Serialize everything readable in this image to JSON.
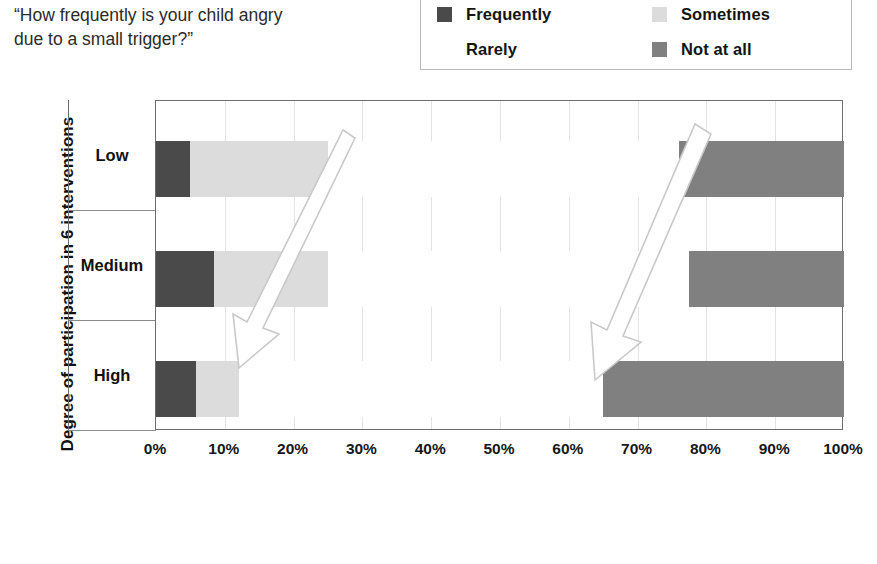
{
  "question": {
    "text": "“How frequently is your child angry\ndue to a small trigger?”"
  },
  "legend": {
    "items": [
      {
        "label": "Frequently",
        "color": "#4a4a4a"
      },
      {
        "label": "Sometimes",
        "color": "#dcdcdc"
      },
      {
        "label": "Rarely",
        "color": "#ffffff"
      },
      {
        "label": "Not at all",
        "color": "#808080"
      }
    ]
  },
  "axes": {
    "y_title": "Degree of participation in  6  interventions",
    "x_ticks": [
      "0%",
      "10%",
      "20%",
      "30%",
      "40%",
      "50%",
      "60%",
      "70%",
      "80%",
      "90%",
      "100%"
    ]
  },
  "chart_data": {
    "type": "bar",
    "orientation": "horizontal",
    "stacked": true,
    "normalized_percent": true,
    "title": "“How frequently is your child angry due to a small trigger?”",
    "xlabel": "",
    "ylabel": "Degree of participation in  6  interventions",
    "xlim": [
      0,
      100
    ],
    "xticks": [
      0,
      10,
      20,
      30,
      40,
      50,
      60,
      70,
      80,
      90,
      100
    ],
    "xticklabels": [
      "0%",
      "10%",
      "20%",
      "30%",
      "40%",
      "50%",
      "60%",
      "70%",
      "80%",
      "90%",
      "100%"
    ],
    "grid": "vertical",
    "legend_position": "top-right",
    "categories": [
      "Low",
      "Medium",
      "High"
    ],
    "series": [
      {
        "name": "Frequently",
        "color": "#4a4a4a",
        "values": [
          5.0,
          8.5,
          5.8
        ]
      },
      {
        "name": "Sometimes",
        "color": "#dcdcdc",
        "values": [
          20.0,
          16.5,
          6.2
        ]
      },
      {
        "name": "Rarely",
        "color": "#ffffff",
        "values": [
          51.0,
          52.5,
          53.0
        ]
      },
      {
        "name": "Not at all",
        "color": "#808080",
        "values": [
          24.0,
          22.5,
          35.0
        ]
      }
    ],
    "annotations": [
      {
        "name": "trend-arrow-left",
        "type": "arrow",
        "direction": "down-left",
        "from_percent": 27,
        "to_percent": 12
      },
      {
        "name": "trend-arrow-right",
        "type": "arrow",
        "direction": "down-left",
        "from_percent": 80,
        "to_percent": 65
      }
    ]
  }
}
